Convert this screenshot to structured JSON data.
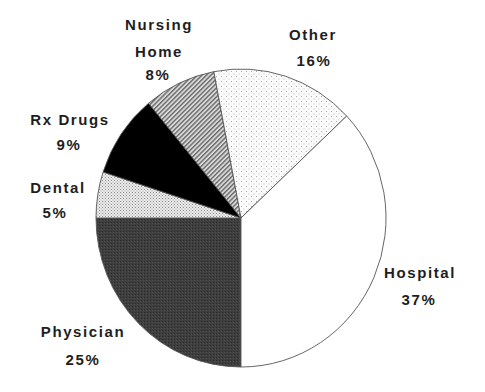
{
  "chart_data": {
    "type": "pie",
    "title": "",
    "start_angle_deg": 180,
    "direction": "counterclockwise",
    "slices": [
      {
        "key": "physician",
        "label": "Physician",
        "lines": [
          "Physician"
        ],
        "value": 25,
        "value_label": "25%",
        "fill": "pat-physician",
        "label_pos": [
          83,
          337
        ],
        "value_pos": [
          83,
          365
        ]
      },
      {
        "key": "dental",
        "label": "Dental",
        "lines": [
          "Dental"
        ],
        "value": 5,
        "value_label": "5%",
        "fill": "pat-dental",
        "label_pos": [
          58,
          193
        ],
        "value_pos": [
          55,
          218
        ]
      },
      {
        "key": "rx-drugs",
        "label": "Rx Drugs",
        "lines": [
          "Rx Drugs"
        ],
        "value": 9,
        "value_label": "9%",
        "fill": "#000000",
        "label_pos": [
          70,
          125
        ],
        "value_pos": [
          69,
          150
        ]
      },
      {
        "key": "nursing-home",
        "label": "Nursing Home",
        "lines": [
          "Nursing",
          "Home"
        ],
        "value": 8,
        "value_label": "8%",
        "fill": "pat-nursing",
        "label_pos": [
          159,
          30
        ],
        "label_pos2": [
          159,
          57
        ],
        "value_pos": [
          158,
          80
        ]
      },
      {
        "key": "other",
        "label": "Other",
        "lines": [
          "Other"
        ],
        "value": 16,
        "value_label": "16%",
        "fill": "pat-other",
        "label_pos": [
          313,
          40
        ],
        "value_pos": [
          314,
          66
        ]
      },
      {
        "key": "hospital",
        "label": "Hospital",
        "lines": [
          "Hospital"
        ],
        "value": 37,
        "value_label": "37%",
        "fill": "#ffffff",
        "label_pos": [
          420,
          278
        ],
        "value_pos": [
          419,
          305
        ]
      }
    ],
    "legend": "none (labels placed around pie)",
    "units": "percent"
  },
  "colors": {
    "physician": "#3c3c3c",
    "rx_drugs": "#000000",
    "hospital": "#ffffff",
    "outline": "#555555",
    "text": "#1e1e1e"
  }
}
